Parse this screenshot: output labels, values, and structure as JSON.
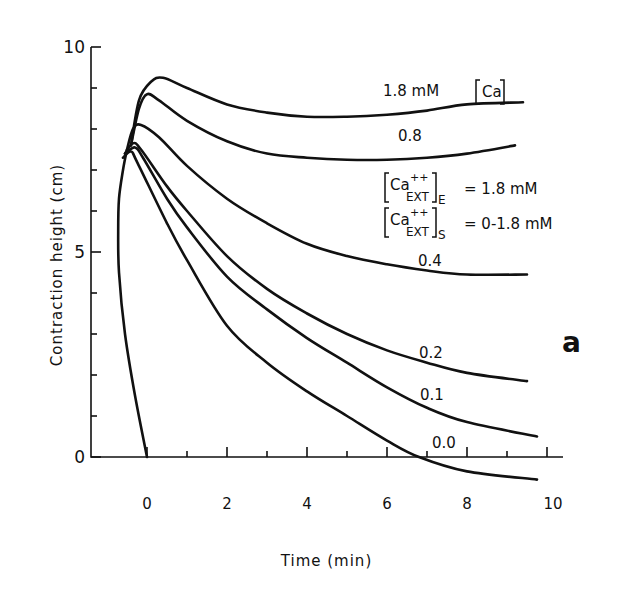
{
  "chart_data": {
    "type": "line",
    "title": "",
    "xlabel": "Time (min)",
    "ylabel": "Contraction height (cm)",
    "xlim": [
      -1.4,
      10.4
    ],
    "ylim": [
      0,
      10
    ],
    "x_ticks": [
      0,
      2,
      4,
      6,
      8,
      10
    ],
    "x_minor_ticks": [
      1,
      3,
      5,
      7,
      9
    ],
    "y_ticks": [
      0,
      5,
      10
    ],
    "y_minor_ticks": [
      1,
      2,
      3,
      4,
      6,
      7,
      8,
      9
    ],
    "grid": false,
    "panel_label": "a",
    "legend_lines": [
      "[Ca++EXT]E = 1.8 mM",
      "[Ca++EXT]S = 0-1.8 mM"
    ],
    "series": [
      {
        "name": "1.8 mM [Ca]",
        "label": "1.8  mM [Ca]",
        "points": [
          [
            -0.4,
            7.6
          ],
          [
            -0.2,
            8.7
          ],
          [
            0.1,
            9.15
          ],
          [
            0.4,
            9.25
          ],
          [
            1,
            9.0
          ],
          [
            2,
            8.6
          ],
          [
            3,
            8.4
          ],
          [
            4,
            8.3
          ],
          [
            5,
            8.3
          ],
          [
            6,
            8.35
          ],
          [
            7,
            8.45
          ],
          [
            8,
            8.6
          ],
          [
            9.4,
            8.65
          ]
        ]
      },
      {
        "name": "0.8",
        "label": "0.8",
        "points": [
          [
            -0.4,
            7.6
          ],
          [
            -0.2,
            8.5
          ],
          [
            0,
            8.85
          ],
          [
            0.3,
            8.7
          ],
          [
            1,
            8.2
          ],
          [
            2,
            7.7
          ],
          [
            3,
            7.4
          ],
          [
            4,
            7.3
          ],
          [
            5,
            7.25
          ],
          [
            6,
            7.25
          ],
          [
            7,
            7.3
          ],
          [
            8,
            7.4
          ],
          [
            9.2,
            7.6
          ]
        ]
      },
      {
        "name": "0.4",
        "label": "0.4",
        "points": [
          [
            -0.5,
            7.5
          ],
          [
            -0.35,
            8.0
          ],
          [
            -0.15,
            8.1
          ],
          [
            0.3,
            7.8
          ],
          [
            1,
            7.1
          ],
          [
            2,
            6.3
          ],
          [
            3,
            5.7
          ],
          [
            4,
            5.2
          ],
          [
            5,
            4.9
          ],
          [
            6,
            4.7
          ],
          [
            7,
            4.55
          ],
          [
            8,
            4.45
          ],
          [
            9.5,
            4.45
          ]
        ]
      },
      {
        "name": "0.2",
        "label": "0.2",
        "points": [
          [
            -0.55,
            7.4
          ],
          [
            -0.35,
            7.65
          ],
          [
            -0.15,
            7.5
          ],
          [
            0.5,
            6.6
          ],
          [
            1,
            6.0
          ],
          [
            2,
            4.9
          ],
          [
            3,
            4.1
          ],
          [
            4,
            3.5
          ],
          [
            5,
            3.0
          ],
          [
            6,
            2.6
          ],
          [
            7,
            2.3
          ],
          [
            8,
            2.05
          ],
          [
            9.5,
            1.85
          ]
        ]
      },
      {
        "name": "0.1",
        "label": "0.1",
        "points": [
          [
            -0.55,
            7.4
          ],
          [
            -0.3,
            7.55
          ],
          [
            -0.1,
            7.3
          ],
          [
            0.5,
            6.3
          ],
          [
            1,
            5.6
          ],
          [
            2,
            4.4
          ],
          [
            3,
            3.6
          ],
          [
            4,
            2.9
          ],
          [
            5,
            2.3
          ],
          [
            6,
            1.7
          ],
          [
            7,
            1.2
          ],
          [
            8,
            0.85
          ],
          [
            9.75,
            0.5
          ]
        ]
      },
      {
        "name": "0.0",
        "label": "0.0",
        "points": [
          [
            -0.6,
            7.3
          ],
          [
            -0.4,
            7.45
          ],
          [
            -0.25,
            7.2
          ],
          [
            0.5,
            5.7
          ],
          [
            1,
            4.8
          ],
          [
            2,
            3.2
          ],
          [
            3,
            2.3
          ],
          [
            4,
            1.6
          ],
          [
            5,
            1.0
          ],
          [
            6,
            0.4
          ],
          [
            6.8,
            0.0
          ],
          [
            8,
            -0.35
          ],
          [
            9.75,
            -0.55
          ]
        ]
      }
    ],
    "rising_phase": {
      "name": "rising edge (all)",
      "points": [
        [
          0.0,
          0.0
        ],
        [
          -0.3,
          1.5
        ],
        [
          -0.55,
          3.0
        ],
        [
          -0.7,
          4.5
        ],
        [
          -0.72,
          5.5
        ],
        [
          -0.7,
          6.3
        ],
        [
          -0.6,
          7.0
        ],
        [
          -0.5,
          7.5
        ]
      ]
    },
    "labels": {
      "c18": "1.8  mM",
      "c08": "0.8",
      "c04": "0.4",
      "c02": "0.2",
      "c01": "0.1",
      "c00": "0.0",
      "ext_e_value": "= 1.8 mM",
      "ext_s_value": "= 0-1.8 mM"
    }
  }
}
